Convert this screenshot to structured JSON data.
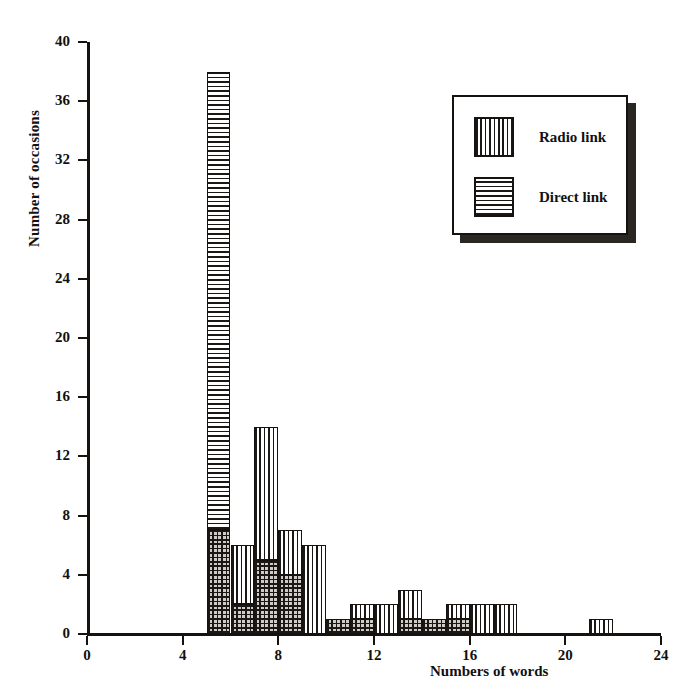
{
  "chart_data": {
    "type": "bar",
    "title": "",
    "xlabel": "Numbers of words",
    "ylabel": "Number of occasions",
    "xlim": [
      0,
      24
    ],
    "ylim": [
      0,
      40
    ],
    "xticks": [
      0,
      4,
      8,
      12,
      16,
      20,
      24
    ],
    "yticks": [
      0,
      4,
      8,
      12,
      16,
      20,
      24,
      28,
      32,
      36,
      40
    ],
    "grid": false,
    "stacked": true,
    "bin_width": 1,
    "legend_position": "top-right",
    "categories": [
      "5",
      "6",
      "7",
      "8",
      "9",
      "10",
      "11",
      "12",
      "13",
      "14",
      "15",
      "16",
      "17",
      "18",
      "19",
      "20",
      "21"
    ],
    "bin_starts": [
      5,
      6,
      7,
      8,
      9,
      10,
      11,
      12,
      13,
      14,
      15,
      16,
      17,
      18,
      19,
      20,
      21
    ],
    "series": [
      {
        "name": "Direct link",
        "pattern": "horizontal-lines",
        "values": [
          7,
          2,
          5,
          4,
          0,
          1,
          1,
          0,
          1,
          1,
          1,
          0,
          0,
          0,
          0,
          0,
          0
        ]
      },
      {
        "name": "Radio link",
        "pattern": "vertical-lines",
        "values": [
          31,
          4,
          9,
          3,
          6,
          0,
          1,
          2,
          2,
          0,
          1,
          2,
          2,
          0,
          0,
          0,
          1
        ]
      }
    ],
    "totals": [
      38,
      6,
      14,
      7,
      6,
      1,
      2,
      2,
      3,
      1,
      2,
      2,
      2,
      0,
      0,
      0,
      1
    ]
  },
  "legend": {
    "entries": [
      {
        "label": "Radio link",
        "pattern": "vertical-lines"
      },
      {
        "label": "Direct link",
        "pattern": "horizontal-lines"
      }
    ]
  },
  "axes": {
    "y_label": "Number of occasions",
    "x_label": "Numbers of words",
    "y_tick_labels": [
      "0",
      "4",
      "8",
      "12",
      "16",
      "20",
      "24",
      "28",
      "32",
      "36",
      "40"
    ],
    "x_tick_labels": [
      "0",
      "4",
      "8",
      "12",
      "16",
      "20",
      "24"
    ]
  },
  "colors": {
    "ink": "#16120f",
    "hatch": "#1b1714",
    "fill": "#e4e2de",
    "background": "#ffffff"
  }
}
